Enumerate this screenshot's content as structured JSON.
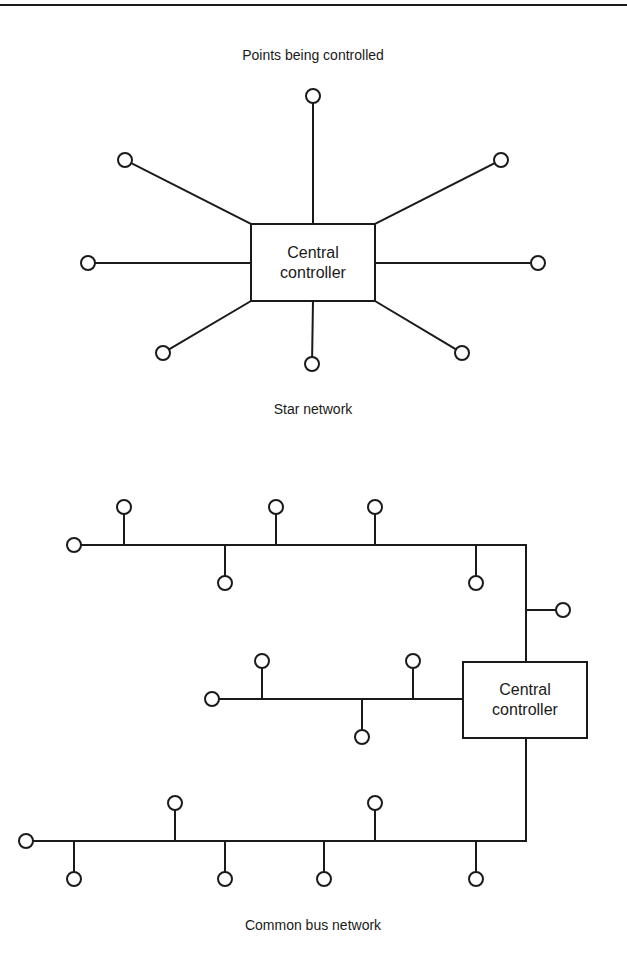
{
  "figure": {
    "top_rule": true,
    "stroke_color": "#1a1a1a"
  },
  "star": {
    "heading": "Points being controlled",
    "caption": "Star network",
    "controller": {
      "line1": "Central",
      "line2": "controller",
      "box": {
        "x": 251,
        "y": 224,
        "w": 124,
        "h": 77
      }
    },
    "nodes": [
      {
        "cx": 313,
        "cy": 96,
        "ax": 313,
        "ay": 224
      },
      {
        "cx": 125,
        "cy": 160,
        "ax": 251,
        "ay": 224
      },
      {
        "cx": 501,
        "cy": 160,
        "ax": 375,
        "ay": 224
      },
      {
        "cx": 88,
        "cy": 263,
        "ax": 251,
        "ay": 263
      },
      {
        "cx": 538,
        "cy": 263,
        "ax": 375,
        "ay": 263
      },
      {
        "cx": 163,
        "cy": 353,
        "ax": 251,
        "ay": 301
      },
      {
        "cx": 312,
        "cy": 364,
        "ax": 313,
        "ay": 301
      },
      {
        "cx": 462,
        "cy": 353,
        "ax": 375,
        "ay": 301
      }
    ]
  },
  "bus": {
    "caption": "Common bus network",
    "controller": {
      "line1": "Central",
      "line2": "controller",
      "box": {
        "x": 463,
        "y": 662,
        "w": 124,
        "h": 76
      }
    },
    "buses": [
      {
        "y": 545,
        "x1": 81,
        "x2": 526,
        "end_node": {
          "cx": 74,
          "cy": 545
        },
        "taps": [
          {
            "x": 124,
            "dir": "up"
          },
          {
            "x": 225,
            "dir": "down"
          },
          {
            "x": 276,
            "dir": "up"
          },
          {
            "x": 375,
            "dir": "up"
          },
          {
            "x": 476,
            "dir": "down"
          }
        ]
      },
      {
        "y": 699,
        "x1": 219,
        "x2": 463,
        "end_node": {
          "cx": 212,
          "cy": 699
        },
        "taps": [
          {
            "x": 262,
            "dir": "up"
          },
          {
            "x": 362,
            "dir": "down"
          },
          {
            "x": 413,
            "dir": "up"
          }
        ]
      },
      {
        "y": 841,
        "x1": 33,
        "x2": 525,
        "end_node": {
          "cx": 26,
          "cy": 841
        },
        "taps": [
          {
            "x": 74,
            "dir": "down"
          },
          {
            "x": 175,
            "dir": "up"
          },
          {
            "x": 225,
            "dir": "down"
          },
          {
            "x": 324,
            "dir": "down"
          },
          {
            "x": 375,
            "dir": "up"
          },
          {
            "x": 476,
            "dir": "down"
          }
        ]
      }
    ],
    "trunk": {
      "x": 526,
      "y_top": 545,
      "y_box_top": 662,
      "y_box_bottom": 738,
      "y_bottom": 841
    },
    "trunk_node": {
      "branch_y": 610,
      "cx": 563,
      "cy": 610
    }
  }
}
